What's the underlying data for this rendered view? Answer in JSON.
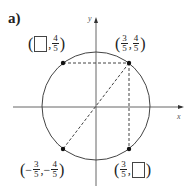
{
  "part_label": "a)",
  "axes": {
    "x_label": "x",
    "y_label": "y"
  },
  "circle": {
    "type": "unit circle",
    "center": [
      0,
      0
    ],
    "radius": 1
  },
  "points": [
    {
      "id": "p1",
      "x": "3/5",
      "y": "4/5",
      "x_num": "3",
      "x_den": "5",
      "y_num": "4",
      "y_den": "5",
      "x_sign": "",
      "y_sign": ""
    },
    {
      "id": "p2",
      "x": "blank",
      "y": "4/5",
      "y_num": "4",
      "y_den": "5",
      "y_sign": ""
    },
    {
      "id": "p3",
      "x": "-3/5",
      "y": "-4/5",
      "x_num": "3",
      "x_den": "5",
      "y_num": "4",
      "y_den": "5",
      "x_sign": "−",
      "y_sign": "−"
    },
    {
      "id": "p4",
      "x": "3/5",
      "y": "blank",
      "x_num": "3",
      "x_den": "5"
    }
  ],
  "punct": {
    "open": "(",
    "close": ")",
    "comma": ","
  }
}
